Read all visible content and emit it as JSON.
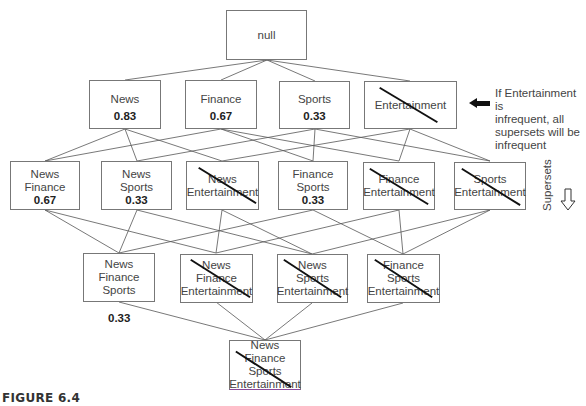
{
  "figure": {
    "caption": "FIGURE 6.4"
  },
  "nodes": {
    "null": {
      "label": "null"
    },
    "news": {
      "label": "News",
      "support": "0.83"
    },
    "finance": {
      "label": "Finance",
      "support": "0.67"
    },
    "sports": {
      "label": "Sports",
      "support": "0.33"
    },
    "entertainment": {
      "label": "Entertainment",
      "pruned": true
    },
    "news_finance": {
      "line1": "News",
      "line2": "Finance",
      "support": "0.67"
    },
    "news_sports": {
      "line1": "News",
      "line2": "Sports",
      "support": "0.33"
    },
    "news_entertainment": {
      "line1": "News",
      "line2": "Entertainment",
      "pruned": true
    },
    "finance_sports": {
      "line1": "Finance",
      "line2": "Sports",
      "support": "0.33"
    },
    "finance_entertainment": {
      "line1": "Finance",
      "line2": "Entertainment",
      "pruned": true
    },
    "sports_entertainment": {
      "line1": "Sports",
      "line2": "Entertainment",
      "pruned": true
    },
    "news_finance_sports": {
      "line1": "News",
      "line2": "Finance",
      "line3": "Sports",
      "support": "0.33"
    },
    "news_finance_entertainment": {
      "line1": "News",
      "line2": "Finance",
      "line3": "Entertainment",
      "pruned": true
    },
    "news_sports_entertainment": {
      "line1": "News",
      "line2": "Sports",
      "line3": "Entertainment",
      "pruned": true
    },
    "finance_sports_entertainment": {
      "line1": "Finance",
      "line2": "Sports",
      "line3": "Entertainment",
      "pruned": true
    },
    "all_four": {
      "line1": "News",
      "line2": "Finance",
      "line3": "Sports",
      "line4": "Entertainment",
      "pruned": true
    }
  },
  "annotations": {
    "pruning_note": {
      "line1": "If Entertainment is",
      "line2": "infrequent, all",
      "line3": "supersets will be",
      "line4": "infrequent"
    },
    "supersets_label": "Supersets",
    "left_arrow_icon": "arrow-left-solid",
    "down_arrow_icon": "arrow-down-outline"
  },
  "colors": {
    "box_border": "#777777",
    "edge": "#555555",
    "strike": "#111111",
    "bottom_border": "#8a4a9a"
  }
}
